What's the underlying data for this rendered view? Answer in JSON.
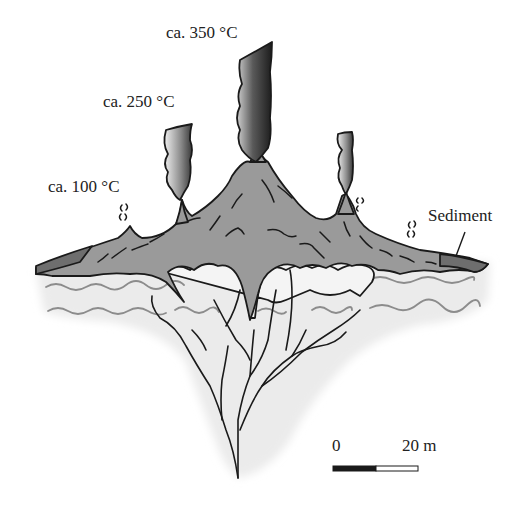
{
  "figure": {
    "type": "cross-section diagram"
  },
  "labels": {
    "vent_high": "ca. 350 °C",
    "vent_mid": "ca. 250 °C",
    "vent_low": "ca. 100 °C",
    "sediment": "Sediment"
  },
  "scale_bar": {
    "start_label": "0",
    "end_label": "20 m"
  },
  "colors": {
    "mound": "#9a9a9a",
    "sediment": "#6e6e6e",
    "subsurface": "#ececec",
    "stockwork": "#f4f4f4",
    "outline": "#1a1a1a",
    "plume_dark": "#2a2a2a"
  }
}
